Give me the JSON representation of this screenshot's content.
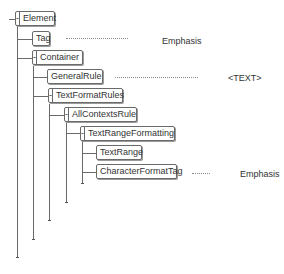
{
  "tree": {
    "nodes": [
      {
        "id": "element",
        "label": "Element",
        "collapsible": true,
        "toggle": "-"
      },
      {
        "id": "tag",
        "label": "Tag",
        "collapsible": false
      },
      {
        "id": "container",
        "label": "Container",
        "collapsible": true,
        "toggle": "-"
      },
      {
        "id": "general-rule",
        "label": "GeneralRule",
        "collapsible": false
      },
      {
        "id": "text-format-rules",
        "label": "TextFormatRules",
        "collapsible": true,
        "toggle": "-"
      },
      {
        "id": "all-contexts-rule",
        "label": "AllContextsRule",
        "collapsible": true,
        "toggle": "-"
      },
      {
        "id": "text-range-formatting",
        "label": "TextRangeFormatting",
        "collapsible": true,
        "toggle": "-"
      },
      {
        "id": "text-range",
        "label": "TextRange",
        "collapsible": false
      },
      {
        "id": "character-format-tag",
        "label": "CharacterFormatTag",
        "collapsible": false
      }
    ],
    "annotations": [
      {
        "target": "tag",
        "text": "Emphasis"
      },
      {
        "target": "general-rule",
        "text": "<TEXT>"
      },
      {
        "target": "character-format-tag",
        "text": "Emphasis"
      }
    ]
  },
  "colors": {
    "line": "#6a6a6a",
    "dots": "#8a8a8a",
    "text": "#333333"
  }
}
